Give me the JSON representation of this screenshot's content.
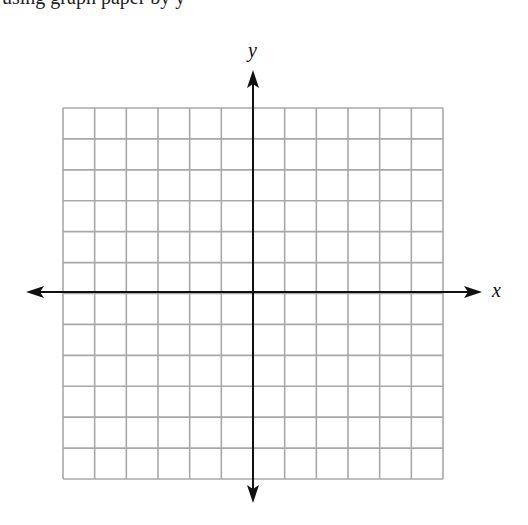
{
  "header": {
    "clipped_text": "using graph paper by y"
  },
  "graph": {
    "x_label": "x",
    "y_label": "y",
    "grid": {
      "columns": 12,
      "rows": 12,
      "left": 63,
      "top": 108,
      "width": 380,
      "height": 371,
      "line_color": "#a8a8a8"
    },
    "axis_color": "#111111"
  },
  "chart_data": {
    "type": "grid",
    "title": "",
    "xlabel": "x",
    "ylabel": "y",
    "xlim": [
      -6,
      6
    ],
    "ylim": [
      -6,
      6
    ],
    "grid": true,
    "tick_labels": false,
    "series": []
  }
}
